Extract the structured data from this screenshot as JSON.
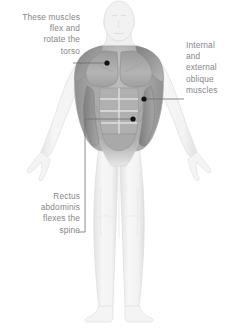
{
  "illustration": {
    "subject": "anterior-male-figure-abdominal-muscles",
    "background_color": "#ffffff",
    "body_fill": "#f2f2f2",
    "body_outline": "#d8d8d8",
    "muscle_light": "#c9c9c9",
    "muscle_mid": "#a8a8a8",
    "muscle_dark": "#8d8d8d",
    "muscle_darkest": "#787878"
  },
  "callouts": [
    {
      "id": "torso",
      "text": "These muscles\nflex and\nrotate the\ntorso",
      "align": "right",
      "marker_color": "#121212",
      "leader_color": "#6f6f73"
    },
    {
      "id": "oblique",
      "text": "Internal\nand\nexternal\noblique\nmuscles",
      "align": "left",
      "marker_color": "#121212",
      "leader_color": "#6f6f73"
    },
    {
      "id": "rectus",
      "text": "Rectus\nabdominis\nflexes the\nspine",
      "align": "right",
      "marker_color": "#121212",
      "leader_color": "#6f6f73"
    }
  ]
}
